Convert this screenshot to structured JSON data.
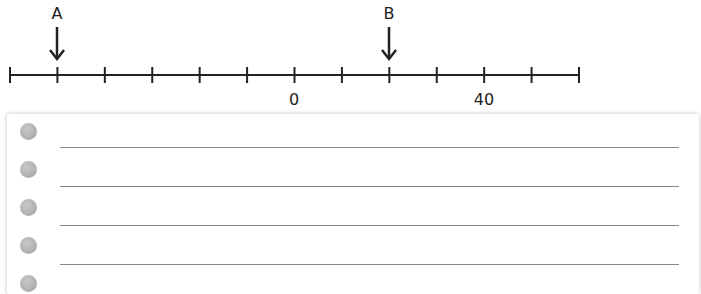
{
  "number_line": {
    "tick_count": 13,
    "tick_interval": 10,
    "labeled_ticks": [
      {
        "value": 0,
        "label": "0"
      },
      {
        "value": 40,
        "label": "40"
      }
    ],
    "markers": [
      {
        "label": "A",
        "value": -50
      },
      {
        "label": "B",
        "value": 20
      }
    ],
    "range": [
      -70,
      50
    ]
  },
  "answer_sheet": {
    "lines": 4,
    "holes": 5
  }
}
